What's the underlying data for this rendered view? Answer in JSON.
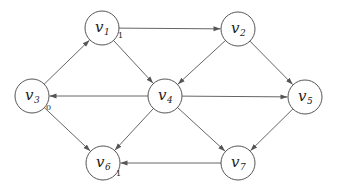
{
  "diagram": {
    "type": "directed-graph",
    "nodes": [
      {
        "id": "v1",
        "label": "v",
        "sub": "1",
        "x": 102,
        "y": 28,
        "annotation": "1"
      },
      {
        "id": "v2",
        "label": "v",
        "sub": "2",
        "x": 238,
        "y": 29,
        "annotation": ""
      },
      {
        "id": "v3",
        "label": "v",
        "sub": "3",
        "x": 32,
        "y": 96,
        "annotation": "0"
      },
      {
        "id": "v4",
        "label": "v",
        "sub": "4",
        "x": 165,
        "y": 96,
        "annotation": ""
      },
      {
        "id": "v5",
        "label": "v",
        "sub": "5",
        "x": 305,
        "y": 97,
        "annotation": ""
      },
      {
        "id": "v6",
        "label": "v",
        "sub": "6",
        "x": 103,
        "y": 163,
        "annotation": "1"
      },
      {
        "id": "v7",
        "label": "v",
        "sub": "7",
        "x": 238,
        "y": 163,
        "annotation": ""
      }
    ],
    "edges": [
      {
        "from": "v1",
        "to": "v2"
      },
      {
        "from": "v1",
        "to": "v4"
      },
      {
        "from": "v3",
        "to": "v1"
      },
      {
        "from": "v2",
        "to": "v4"
      },
      {
        "from": "v2",
        "to": "v5"
      },
      {
        "from": "v4",
        "to": "v3"
      },
      {
        "from": "v4",
        "to": "v5"
      },
      {
        "from": "v4",
        "to": "v6"
      },
      {
        "from": "v4",
        "to": "v7"
      },
      {
        "from": "v3",
        "to": "v6"
      },
      {
        "from": "v5",
        "to": "v7"
      },
      {
        "from": "v7",
        "to": "v6"
      }
    ],
    "node_radius": 17,
    "colors": {
      "stroke": "#555555",
      "edge": "#666666",
      "text": "#222222",
      "background": "#ffffff"
    }
  }
}
